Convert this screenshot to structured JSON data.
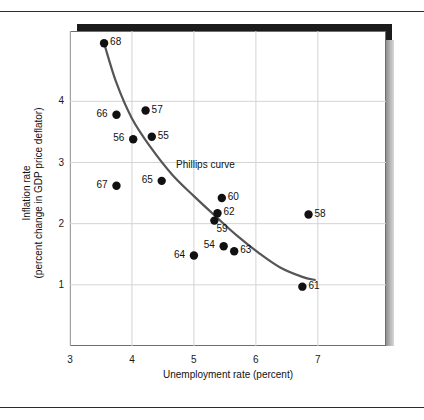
{
  "figure": {
    "xaxis_title": "Unemployment rate (percent)",
    "yaxis_title_line1": "Inflation rate",
    "yaxis_title_line2": "(percent change in GDP price deflator)",
    "curve_annotation": "Phillips curve"
  },
  "chart_data": {
    "type": "scatter",
    "title": "",
    "xlabel": "Unemployment rate (percent)",
    "ylabel": "Inflation rate (percent change in GDP price deflator)",
    "xlim": [
      3,
      8.1
    ],
    "ylim": [
      0.0,
      5.15
    ],
    "xticks": [
      "3",
      "4",
      "5",
      "6",
      "7"
    ],
    "xtick_values": [
      3,
      4,
      5,
      6,
      7
    ],
    "yticks": [
      "1",
      "2",
      "3",
      "4"
    ],
    "ytick_values": [
      1,
      2,
      3,
      4
    ],
    "grid": true,
    "legend": "none",
    "annotations": [
      {
        "text": "Phillips curve",
        "x": 4.72,
        "y": 2.85
      }
    ],
    "points": [
      {
        "label": "68",
        "x": 3.55,
        "y": 4.95,
        "label_side": "right"
      },
      {
        "label": "66",
        "x": 3.75,
        "y": 3.78,
        "label_side": "left"
      },
      {
        "label": "57",
        "x": 4.22,
        "y": 3.85,
        "label_side": "right"
      },
      {
        "label": "56",
        "x": 4.02,
        "y": 3.38,
        "label_side": "left"
      },
      {
        "label": "55",
        "x": 4.32,
        "y": 3.42,
        "label_side": "right"
      },
      {
        "label": "67",
        "x": 3.75,
        "y": 2.62,
        "label_side": "left"
      },
      {
        "label": "65",
        "x": 4.48,
        "y": 2.7,
        "label_side": "left"
      },
      {
        "label": "60",
        "x": 5.45,
        "y": 2.42,
        "label_side": "right"
      },
      {
        "label": "62",
        "x": 5.38,
        "y": 2.17,
        "label_side": "right"
      },
      {
        "label": "59",
        "x": 5.33,
        "y": 2.05,
        "label_side": "below-right"
      },
      {
        "label": "58",
        "x": 6.85,
        "y": 2.15,
        "label_side": "right"
      },
      {
        "label": "54",
        "x": 5.48,
        "y": 1.63,
        "label_side": "left"
      },
      {
        "label": "63",
        "x": 5.65,
        "y": 1.55,
        "label_side": "right"
      },
      {
        "label": "64",
        "x": 5.0,
        "y": 1.48,
        "label_side": "left"
      },
      {
        "label": "61",
        "x": 6.75,
        "y": 0.97,
        "label_side": "right"
      }
    ],
    "curve": {
      "name": "Phillips curve",
      "color": "#555555",
      "points": [
        {
          "x": 3.55,
          "y": 4.95
        },
        {
          "x": 3.75,
          "y": 4.3
        },
        {
          "x": 4.0,
          "y": 3.72
        },
        {
          "x": 4.3,
          "y": 3.25
        },
        {
          "x": 4.65,
          "y": 2.8
        },
        {
          "x": 5.0,
          "y": 2.45
        },
        {
          "x": 5.35,
          "y": 2.12
        },
        {
          "x": 5.7,
          "y": 1.8
        },
        {
          "x": 6.05,
          "y": 1.52
        },
        {
          "x": 6.4,
          "y": 1.28
        },
        {
          "x": 6.75,
          "y": 1.13
        },
        {
          "x": 6.95,
          "y": 1.08
        }
      ]
    },
    "colors": {
      "point": "#111111",
      "curve": "#555555",
      "grid": "#d4d4d4",
      "axis": "#6e6e6e",
      "text": "#111111"
    }
  }
}
